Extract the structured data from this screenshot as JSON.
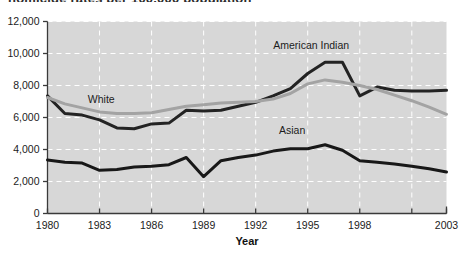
{
  "figure": {
    "cropped_title_fragment": "homicide rates per 100,000 population",
    "x_axis_title": "Year",
    "plot_background_color": "#d7d7d7",
    "gridline_color": "#ffffff",
    "axis_color": "#3a3a3a"
  },
  "chart_data": {
    "type": "line",
    "title": "",
    "xlabel": "Year",
    "ylabel": "",
    "xlim": [
      1980,
      2003
    ],
    "ylim": [
      0,
      12000
    ],
    "ytick_labels": [
      "0",
      "2,000",
      "4,000",
      "6,000",
      "8,000",
      "10,000",
      "12,000"
    ],
    "yticks": [
      0,
      2000,
      4000,
      6000,
      8000,
      10000,
      12000
    ],
    "xtick_labels": [
      "1980",
      "1983",
      "1986",
      "1989",
      "1992",
      "1995",
      "1998",
      "",
      "2003"
    ],
    "xticks": [
      1980,
      1983,
      1986,
      1989,
      1992,
      1995,
      1998,
      2001,
      2003
    ],
    "grid": true,
    "legend_position": "inline-annotations",
    "x": [
      1980,
      1981,
      1982,
      1983,
      1984,
      1985,
      1986,
      1987,
      1988,
      1989,
      1990,
      1991,
      1992,
      1993,
      1994,
      1995,
      1996,
      1997,
      1998,
      1999,
      2000,
      2001,
      2002,
      2003
    ],
    "series": [
      {
        "name": "American Indian",
        "color": "#232323",
        "line_width": 3,
        "label_x": 1995.2,
        "label_y": 10450,
        "values": [
          7350,
          6250,
          6150,
          5850,
          5350,
          5300,
          5600,
          5650,
          6450,
          6400,
          6450,
          6700,
          6950,
          7350,
          7800,
          8750,
          9450,
          9450,
          7350,
          7900,
          7700,
          7650,
          7650,
          7700
        ]
      },
      {
        "name": "White",
        "color": "#a3a3a3",
        "line_width": 3,
        "label_x": 1983.1,
        "label_y": 7100,
        "values": [
          7250,
          6850,
          6600,
          6350,
          6250,
          6250,
          6300,
          6500,
          6700,
          6800,
          6900,
          6950,
          7000,
          7150,
          7500,
          8100,
          8350,
          8200,
          8000,
          7750,
          7400,
          7050,
          6650,
          6200
        ]
      },
      {
        "name": "Asian",
        "color": "#181818",
        "line_width": 3,
        "label_x": 1994.1,
        "label_y": 5150,
        "values": [
          3350,
          3200,
          3150,
          2700,
          2750,
          2900,
          2950,
          3050,
          3500,
          2300,
          3300,
          3500,
          3650,
          3900,
          4050,
          4050,
          4300,
          3950,
          3300,
          3200,
          3100,
          2950,
          2800,
          2600
        ]
      }
    ]
  }
}
